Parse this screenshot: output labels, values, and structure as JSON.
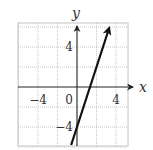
{
  "chart_data": {
    "type": "line",
    "title": "",
    "xlabel": "x",
    "ylabel": "y",
    "xlim": [
      -6,
      5.3
    ],
    "ylim": [
      -6,
      6.4
    ],
    "grid": true,
    "grid_spacing": 2,
    "x_tick_labels": [
      "−4",
      "0",
      "4"
    ],
    "x_ticks": [
      -4,
      0,
      4
    ],
    "y_tick_labels": [
      "4",
      "−4"
    ],
    "y_ticks": [
      4,
      -4
    ],
    "series": [
      {
        "name": "y = 3x − 4",
        "slope": 3,
        "intercept": -4,
        "x": [
          -0.6,
          3.3
        ],
        "y": [
          -5.8,
          5.9
        ],
        "arrow_end": "top"
      }
    ],
    "legend": null
  },
  "colors": {
    "line": "#111111",
    "axis": "#222222",
    "grid": "#b8b8b8",
    "background": "#ffffff"
  }
}
